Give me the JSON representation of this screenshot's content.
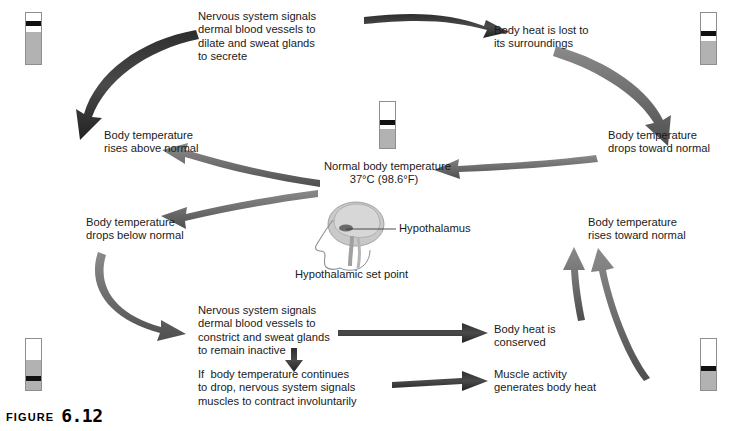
{
  "figure": {
    "word": "FIGURE",
    "number": "6.12"
  },
  "center": {
    "line1": "Normal body temperature",
    "line2": "37°C (98.6°F)",
    "hypothalamus_label": "Hypothalamus",
    "set_point_caption": "Hypothalamic set point"
  },
  "nodes": {
    "top_left_signal": "Nervous system signals\ndermal blood vessels to\ndilate and sweat glands\nto secrete",
    "top_right_effect": "Body heat is lost to\nits surroundings",
    "left_rises_above": "Body temperature\nrises above normal",
    "right_drops_toward": "Body temperature\ndrops toward normal",
    "left_drops_below": "Body temperature\ndrops below normal",
    "right_rises_toward": "Body temperature\nrises toward normal",
    "bottom_left_signal": "Nervous system signals\ndermal blood vessels to\nconstrict and sweat glands\nto remain inactive",
    "bottom_right_conserved": "Body heat is\nconserved",
    "bottom_left_shiver": "If  body temperature continues\nto drop, nervous system signals\nmuscles to contract involuntarily",
    "bottom_right_muscle": "Muscle activity\ngenerates body heat"
  },
  "thermometers": [
    {
      "name": "thermometer-top-left",
      "level_pct": 62,
      "band_top_pct": 16
    },
    {
      "name": "thermometer-top-right",
      "level_pct": 46,
      "band_top_pct": 36
    },
    {
      "name": "thermometer-center",
      "level_pct": 42,
      "band_top_pct": 40
    },
    {
      "name": "thermometer-bottom-left",
      "level_pct": 58,
      "band_top_pct": 72
    },
    {
      "name": "thermometer-bottom-right",
      "level_pct": 38,
      "band_top_pct": 52
    }
  ],
  "colors": {
    "arrow_fill": "#6e6e6e",
    "arrow_dark": "#3c3c3c",
    "thermo_fill": "#b2b2b2",
    "thermo_band": "#111111",
    "text": "#1a1a1a",
    "brain": "#c9c9c9",
    "outline": "#8e8e8e"
  }
}
